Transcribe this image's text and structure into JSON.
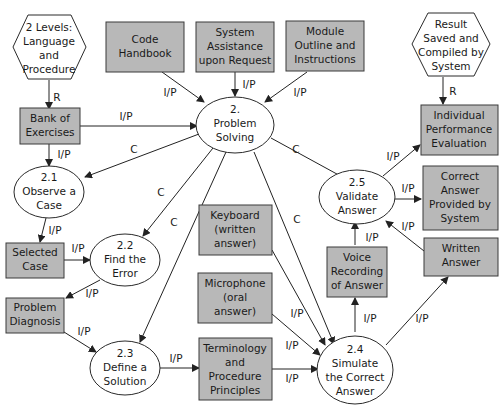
{
  "diagram": {
    "type": "flow",
    "fill_color_box": "#b8b8b8",
    "nodes": {
      "levels": {
        "shape": "hexagon",
        "lines": [
          "2 Levels:",
          "Language",
          "and",
          "Procedure"
        ]
      },
      "code": {
        "shape": "box",
        "lines": [
          "Code",
          "Handbook"
        ]
      },
      "assist": {
        "shape": "box",
        "lines": [
          "System",
          "Assistance",
          "upon Request"
        ]
      },
      "module": {
        "shape": "box",
        "lines": [
          "Module",
          "Outline and",
          "Instructions"
        ]
      },
      "result": {
        "shape": "hexagon",
        "lines": [
          "Result",
          "Saved and",
          "Compiled by",
          "System"
        ]
      },
      "bank": {
        "shape": "box",
        "lines": [
          "Bank of",
          "Exercises"
        ]
      },
      "p2": {
        "shape": "ellipse",
        "lines": [
          "2.",
          "Problem",
          "Solving"
        ]
      },
      "indiv": {
        "shape": "box",
        "lines": [
          "Individual",
          "Performance",
          "Evaluation"
        ]
      },
      "p21": {
        "shape": "ellipse",
        "lines": [
          "2.1",
          "Observe a",
          "Case"
        ]
      },
      "p25": {
        "shape": "ellipse",
        "lines": [
          "2.5",
          "Validate",
          "Answer"
        ]
      },
      "correct": {
        "shape": "box",
        "lines": [
          "Correct",
          "Answer",
          "Provided by",
          "System"
        ]
      },
      "keyboard": {
        "shape": "box",
        "lines": [
          "Keyboard",
          "(written",
          "answer)"
        ]
      },
      "selected": {
        "shape": "box",
        "lines": [
          "Selected",
          "Case"
        ]
      },
      "p22": {
        "shape": "ellipse",
        "lines": [
          "2.2",
          "Find the",
          "Error"
        ]
      },
      "written": {
        "shape": "box",
        "lines": [
          "Written",
          "Answer"
        ]
      },
      "voice": {
        "shape": "box",
        "lines": [
          "Voice",
          "Recording",
          "of Answer"
        ]
      },
      "micro": {
        "shape": "box",
        "lines": [
          "Microphone",
          "(oral",
          "answer)"
        ]
      },
      "diag": {
        "shape": "box",
        "lines": [
          "Problem",
          "Diagnosis"
        ]
      },
      "p23": {
        "shape": "ellipse",
        "lines": [
          "2.3",
          "Define a",
          "Solution"
        ]
      },
      "term": {
        "shape": "box",
        "lines": [
          "Terminology",
          "and",
          "Procedure",
          "Principles"
        ]
      },
      "p24": {
        "shape": "ellipse",
        "lines": [
          "2.4",
          "Simulate",
          "the Correct",
          "Answer"
        ]
      }
    },
    "edges": [
      {
        "from": "levels",
        "to": "bank",
        "label": "R"
      },
      {
        "from": "result",
        "to": "indiv",
        "label": "R"
      },
      {
        "from": "code",
        "to": "p2",
        "label": "I/P"
      },
      {
        "from": "assist",
        "to": "p2",
        "label": "I/P"
      },
      {
        "from": "module",
        "to": "p2",
        "label": "I/P"
      },
      {
        "from": "bank",
        "to": "p2",
        "label": "I/P"
      },
      {
        "from": "bank",
        "to": "p21",
        "label": "I/P"
      },
      {
        "from": "p2",
        "to": "p21",
        "label": "C"
      },
      {
        "from": "p2",
        "to": "p22",
        "label": "C"
      },
      {
        "from": "p2",
        "to": "p23",
        "label": "C"
      },
      {
        "from": "p2",
        "to": "p24",
        "label": "C"
      },
      {
        "from": "p2",
        "to": "p25",
        "label": "C"
      },
      {
        "from": "p21",
        "to": "selected",
        "label": "I/P"
      },
      {
        "from": "selected",
        "to": "p22",
        "label": "I/P"
      },
      {
        "from": "p22",
        "to": "diag",
        "label": "I/P"
      },
      {
        "from": "diag",
        "to": "p23",
        "label": "I/P"
      },
      {
        "from": "p23",
        "to": "term",
        "label": "I/P"
      },
      {
        "from": "term",
        "to": "p24",
        "label": "I/P"
      },
      {
        "from": "micro",
        "to": "p24",
        "label": "I/P"
      },
      {
        "from": "keyboard",
        "to": "p24",
        "label": "I/P"
      },
      {
        "from": "p24",
        "to": "voice",
        "label": "I/P"
      },
      {
        "from": "p24",
        "to": "written",
        "label": "I/P"
      },
      {
        "from": "voice",
        "to": "p25",
        "label": "I/P"
      },
      {
        "from": "written",
        "to": "p25",
        "label": "I/P"
      },
      {
        "from": "p25",
        "to": "indiv",
        "label": "I/P"
      },
      {
        "from": "p25",
        "to": "correct",
        "label": "I/P"
      }
    ]
  }
}
